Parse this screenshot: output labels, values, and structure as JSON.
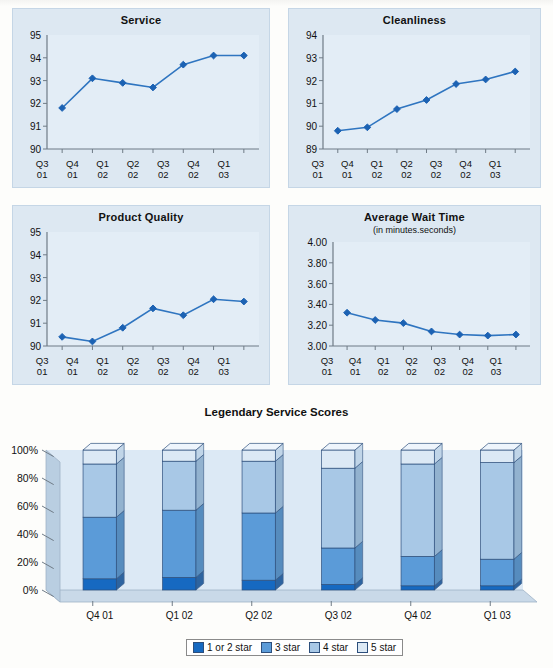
{
  "colors": {
    "line": "#2f75c0",
    "marker": "#1c62b3",
    "panel_bg": "#dde8f2",
    "plot_bg": "#e3edf6",
    "axis": "#6f7b86",
    "s1": "#1669c1",
    "s2": "#5b9bd8",
    "s3": "#a8c8e6",
    "s4": "#dce9f5",
    "stroke": "#2d4f7c"
  },
  "panels": [
    {
      "title": "Service",
      "subtitle": "",
      "yticks": [
        "95",
        "94",
        "93",
        "92",
        "91",
        "90"
      ],
      "ylim": [
        90,
        95
      ],
      "xticks": [
        [
          "Q3",
          "01"
        ],
        [
          "Q4",
          "01"
        ],
        [
          "Q1",
          "02"
        ],
        [
          "Q2",
          "02"
        ],
        [
          "Q3",
          "02"
        ],
        [
          "Q4",
          "02"
        ],
        [
          "Q1",
          "03"
        ]
      ],
      "values": [
        91.8,
        93.1,
        92.9,
        92.7,
        93.7,
        94.1,
        94.1
      ]
    },
    {
      "title": "Cleanliness",
      "subtitle": "",
      "yticks": [
        "94",
        "93",
        "92",
        "91",
        "90",
        "89"
      ],
      "ylim": [
        89,
        94
      ],
      "xticks": [
        [
          "Q3",
          "01"
        ],
        [
          "Q4",
          "01"
        ],
        [
          "Q1",
          "02"
        ],
        [
          "Q2",
          "02"
        ],
        [
          "Q3",
          "02"
        ],
        [
          "Q4",
          "02"
        ],
        [
          "Q1",
          "03"
        ]
      ],
      "values": [
        89.8,
        89.95,
        90.75,
        91.15,
        91.85,
        92.05,
        92.4
      ]
    },
    {
      "title": "Product Quality",
      "subtitle": "",
      "yticks": [
        "95",
        "94",
        "93",
        "92",
        "91",
        "90"
      ],
      "ylim": [
        90,
        95
      ],
      "xticks": [
        [
          "Q3",
          "01"
        ],
        [
          "Q4",
          "01"
        ],
        [
          "Q1",
          "02"
        ],
        [
          "Q2",
          "02"
        ],
        [
          "Q3",
          "02"
        ],
        [
          "Q4",
          "02"
        ],
        [
          "Q1",
          "03"
        ]
      ],
      "values": [
        90.4,
        90.2,
        90.8,
        91.65,
        91.35,
        92.05,
        91.95
      ]
    },
    {
      "title": "Average Wait Time",
      "subtitle": "(in minutes.seconds)",
      "yticks": [
        "4.00",
        "3.80",
        "3.60",
        "3.40",
        "3.20",
        "3.00"
      ],
      "ylim": [
        3.0,
        4.0
      ],
      "xticks": [
        [
          "Q3",
          "01"
        ],
        [
          "Q4",
          "01"
        ],
        [
          "Q1",
          "02"
        ],
        [
          "Q2",
          "02"
        ],
        [
          "Q3",
          "02"
        ],
        [
          "Q4",
          "02"
        ],
        [
          "Q1",
          "03"
        ]
      ],
      "values": [
        3.32,
        3.25,
        3.22,
        3.14,
        3.11,
        3.1,
        3.11
      ]
    }
  ],
  "bar": {
    "title": "Legendary Service Scores",
    "yticks": [
      "100%",
      "80%",
      "60%",
      "40%",
      "20%",
      "0%"
    ],
    "categories": [
      "Q4 01",
      "Q1 02",
      "Q2 02",
      "Q3 02",
      "Q4 02",
      "Q1 03"
    ],
    "legend": [
      "1 or 2 star",
      "3 star",
      "4 star",
      "5 star"
    ]
  },
  "chart_data": [
    {
      "type": "line",
      "title": "Service",
      "xlabel": "",
      "ylabel": "",
      "ylim": [
        90,
        95
      ],
      "grid": false,
      "x": [
        "Q3 01",
        "Q4 01",
        "Q1 02",
        "Q2 02",
        "Q3 02",
        "Q4 02",
        "Q1 03"
      ],
      "values": [
        91.8,
        93.1,
        92.9,
        92.7,
        93.7,
        94.1,
        94.1
      ]
    },
    {
      "type": "line",
      "title": "Cleanliness",
      "xlabel": "",
      "ylabel": "",
      "ylim": [
        89,
        94
      ],
      "grid": false,
      "x": [
        "Q3 01",
        "Q4 01",
        "Q1 02",
        "Q2 02",
        "Q3 02",
        "Q4 02",
        "Q1 03"
      ],
      "values": [
        89.8,
        89.95,
        90.75,
        91.15,
        91.85,
        92.05,
        92.4
      ]
    },
    {
      "type": "line",
      "title": "Product Quality",
      "xlabel": "",
      "ylabel": "",
      "ylim": [
        90,
        95
      ],
      "grid": false,
      "x": [
        "Q3 01",
        "Q4 01",
        "Q1 02",
        "Q2 02",
        "Q3 02",
        "Q4 02",
        "Q1 03"
      ],
      "values": [
        90.4,
        90.2,
        90.8,
        91.65,
        91.35,
        92.05,
        91.95
      ]
    },
    {
      "type": "line",
      "title": "Average Wait Time (in minutes.seconds)",
      "xlabel": "",
      "ylabel": "minutes.seconds",
      "ylim": [
        3.0,
        4.0
      ],
      "grid": false,
      "x": [
        "Q3 01",
        "Q4 01",
        "Q1 02",
        "Q2 02",
        "Q3 02",
        "Q4 02",
        "Q1 03"
      ],
      "values": [
        3.32,
        3.25,
        3.22,
        3.14,
        3.11,
        3.1,
        3.11
      ]
    },
    {
      "type": "bar",
      "stacked": true,
      "title": "Legendary Service Scores",
      "xlabel": "",
      "ylabel": "",
      "ylim": [
        0,
        100
      ],
      "grid": false,
      "legend_position": "bottom",
      "categories": [
        "Q4 01",
        "Q1 02",
        "Q2 02",
        "Q3 02",
        "Q4 02",
        "Q1 03"
      ],
      "series": [
        {
          "name": "1 or 2 star",
          "values": [
            8,
            9,
            7,
            4,
            3,
            3
          ]
        },
        {
          "name": "3 star",
          "values": [
            44,
            48,
            48,
            26,
            21,
            19
          ]
        },
        {
          "name": "4 star",
          "values": [
            38,
            35,
            37,
            57,
            66,
            69
          ]
        },
        {
          "name": "5 star",
          "values": [
            10,
            8,
            8,
            13,
            10,
            9
          ]
        }
      ]
    }
  ]
}
